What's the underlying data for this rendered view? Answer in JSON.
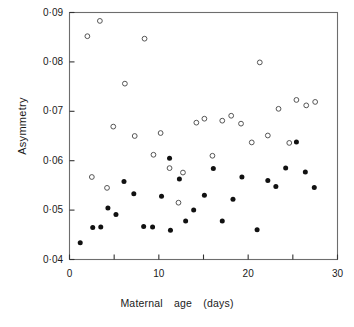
{
  "chart_data": {
    "type": "scatter",
    "title": "",
    "xlabel": "Maternal age (days)",
    "ylabel": "Asymmetry",
    "xlabel_parts": [
      "Maternal",
      "age",
      "(days)"
    ],
    "xlim": [
      0,
      30
    ],
    "ylim": [
      0.04,
      0.09
    ],
    "grid": false,
    "legend": "none",
    "x_ticks": [
      0,
      5,
      10,
      15,
      20,
      25,
      30
    ],
    "x_tick_labels": [
      "0",
      "",
      "10",
      "",
      "20",
      "",
      "30"
    ],
    "y_ticks": [
      0.04,
      0.05,
      0.06,
      0.07,
      0.08,
      0.09
    ],
    "y_tick_labels": [
      "0·04",
      "0·05",
      "0·06",
      "0·07",
      "0·08",
      "0·09"
    ],
    "series": [
      {
        "name": "open-circles",
        "marker": "open-circle",
        "color": "#555555",
        "points": [
          [
            2.0,
            0.0852
          ],
          [
            3.4,
            0.0883
          ],
          [
            8.4,
            0.0847
          ],
          [
            6.2,
            0.0756
          ],
          [
            21.3,
            0.0799
          ],
          [
            4.9,
            0.0669
          ],
          [
            7.3,
            0.065
          ],
          [
            10.2,
            0.0656
          ],
          [
            9.4,
            0.0612
          ],
          [
            11.2,
            0.0585
          ],
          [
            12.7,
            0.0576
          ],
          [
            14.2,
            0.0677
          ],
          [
            15.1,
            0.0685
          ],
          [
            17.1,
            0.0681
          ],
          [
            18.1,
            0.0691
          ],
          [
            19.2,
            0.0675
          ],
          [
            16.0,
            0.061
          ],
          [
            20.4,
            0.0637
          ],
          [
            22.2,
            0.0651
          ],
          [
            23.4,
            0.0705
          ],
          [
            24.6,
            0.0636
          ],
          [
            25.4,
            0.0723
          ],
          [
            26.5,
            0.0712
          ],
          [
            27.5,
            0.0719
          ],
          [
            2.5,
            0.0567
          ],
          [
            4.2,
            0.0545
          ],
          [
            12.2,
            0.0515
          ]
        ]
      },
      {
        "name": "filled-circles",
        "marker": "filled-circle",
        "color": "#111111",
        "points": [
          [
            1.2,
            0.0434
          ],
          [
            2.6,
            0.0465
          ],
          [
            3.5,
            0.0466
          ],
          [
            4.3,
            0.0504
          ],
          [
            5.2,
            0.0491
          ],
          [
            6.1,
            0.0558
          ],
          [
            7.2,
            0.0533
          ],
          [
            8.3,
            0.0467
          ],
          [
            9.3,
            0.0466
          ],
          [
            10.3,
            0.0528
          ],
          [
            11.3,
            0.0459
          ],
          [
            11.2,
            0.0605
          ],
          [
            12.3,
            0.0563
          ],
          [
            13.0,
            0.0478
          ],
          [
            13.9,
            0.05
          ],
          [
            15.1,
            0.053
          ],
          [
            16.1,
            0.0584
          ],
          [
            17.1,
            0.0478
          ],
          [
            18.3,
            0.0522
          ],
          [
            19.3,
            0.0567
          ],
          [
            21.0,
            0.046
          ],
          [
            22.2,
            0.056
          ],
          [
            23.1,
            0.0548
          ],
          [
            24.2,
            0.0585
          ],
          [
            25.4,
            0.0638
          ],
          [
            26.4,
            0.0577
          ],
          [
            27.4,
            0.0546
          ]
        ]
      }
    ]
  },
  "axes": {
    "frame_color": "#6d6d6d",
    "axis_color": "#333333"
  }
}
